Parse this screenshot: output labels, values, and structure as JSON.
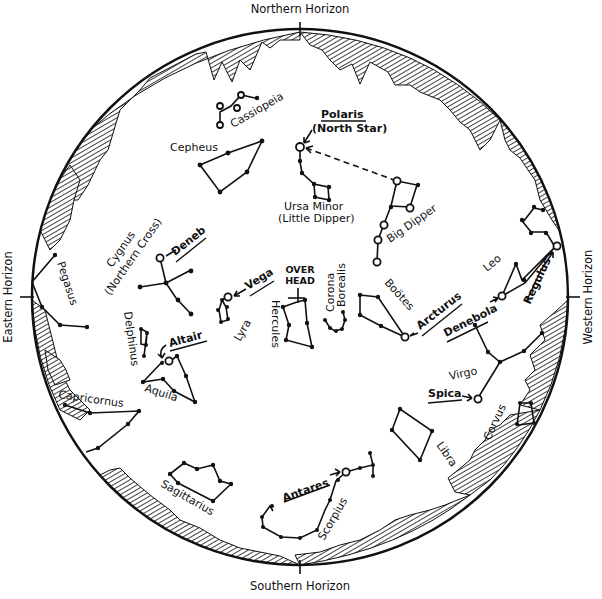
{
  "horizons": {
    "north": "Northern Horizon",
    "south": "Southern Horizon",
    "east": "Eastern Horizon",
    "west": "Western Horizon"
  },
  "center_marker": {
    "line1": "OVER",
    "line2": "HEAD"
  },
  "constellations": {
    "cassiopeia": "Cassiopeia",
    "cepheus": "Cepheus",
    "ursa_minor": "Ursa Minor",
    "ursa_minor_alt": "(Little Dipper)",
    "big_dipper": "Big Dipper",
    "cygnus": "Cygnus",
    "cygnus_alt": "(Northern Cross)",
    "pegasus": "Pegasus",
    "delphinus": "Delphinus",
    "aquila": "Aquila",
    "lyra": "Lyra",
    "hercules": "Hercules",
    "corona_borealis_1": "Corona",
    "corona_borealis_2": "Borealis",
    "bootes": "Boötes",
    "leo": "Leo",
    "virgo": "Virgo",
    "corvus": "Corvus",
    "libra": "Libra",
    "scorpius": "Scorpius",
    "sagittarius": "Sagittarius",
    "capricornus": "Capricornus"
  },
  "stars": {
    "polaris": "Polaris",
    "polaris_alt": "(North Star)",
    "deneb": "Deneb",
    "vega": "Vega",
    "altair": "Altair",
    "arcturus": "Arcturus",
    "denebola": "Denebola",
    "regulus": "Regulus",
    "spica": "Spica",
    "antares": "Antares"
  }
}
